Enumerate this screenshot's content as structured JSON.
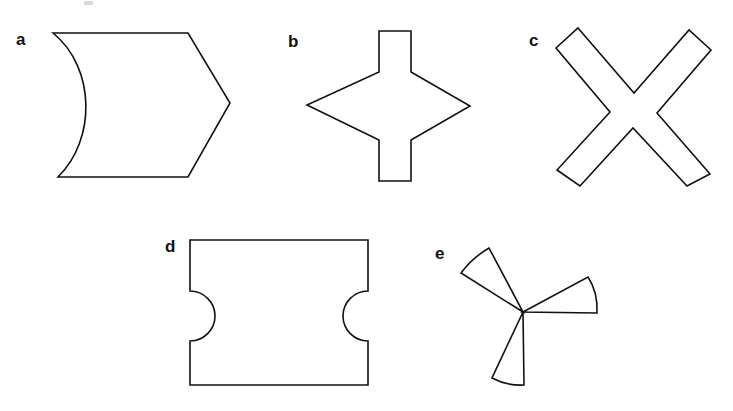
{
  "figure": {
    "background_color": "#ffffff",
    "stroke_color": "#111111",
    "width": 733,
    "height": 411,
    "panels": [
      {
        "id": "a",
        "label": "a",
        "label_x": 16,
        "label_y": 45,
        "shape_name": "concave-left-pentagon-arrow",
        "description": "Five-sided arrow-like block with a flat top, a pointed right vertex, a flat bottom and a left side that curves inward (concave) toward the right.",
        "path": "M 53 33 L 188 33 L 230 103 L 188 177 L 58 177 C 96 140 96 68 53 33 Z"
      },
      {
        "id": "b",
        "label": "b",
        "label_x": 288,
        "label_y": 47,
        "shape_name": "diamond-with-top-and-bottom-tabs",
        "description": "A horizontal diamond (rhombus) with a rectangular tab projecting upward from the top vertex region and a matching rectangular tab projecting downward from the bottom.",
        "path": "M 379 31 L 411 31 L 411 72 L 470 106 L 411 140 L 411 181 L 379 181 L 379 140 L 307 105 L 379 72 Z"
      },
      {
        "id": "c",
        "label": "c",
        "label_x": 529,
        "label_y": 46,
        "shape_name": "diagonal-cross-x",
        "description": "A thick twelve-sided cross rotated about 45 degrees, forming an X with blunt squared arm ends.",
        "path": "M 578 28 L 634 93 L 689 30 L 711 50 L 657 113 L 710 174 L 687 186 L 633 128 L 580 186 L 557 170 L 610 112 L 556 48 Z"
      },
      {
        "id": "d",
        "label": "d",
        "label_x": 165,
        "label_y": 252,
        "shape_name": "rectangle-with-side-semicircular-notches",
        "description": "A wide rectangle with a semicircular bite removed from the middle of the left edge and another from the middle of the right edge.",
        "path": "M 190 240 L 368 240 L 368 291 A 25 25 0 0 0 368 341 L 368 385 L 190 385 L 190 341 A 25 25 0 0 0 190 291 Z"
      },
      {
        "id": "e",
        "label": "e",
        "label_x": 435,
        "label_y": 259,
        "shape_name": "three-bladed-pinwheel",
        "description": "Three narrow circular-sector blades meeting at a single central point, one pointing upper-left, one pointing right, one pointing down.",
        "center_x": 523,
        "center_y": 312,
        "blades": [
          {
            "name": "upper-left-blade",
            "path": "M 523 312 L 461 273 Q 472 258 489 248 L 523 312 Z"
          },
          {
            "name": "right-blade",
            "path": "M 523 312 L 588 277 Q 598 292 597 313 L 523 312 Z"
          },
          {
            "name": "bottom-blade",
            "path": "M 523 312 L 492 378 Q 507 386 524 385 L 523 312 Z"
          }
        ]
      }
    ],
    "artifact": {
      "name": "scan-speck",
      "x": 84,
      "y": 1,
      "width": 9,
      "height": 4
    }
  }
}
